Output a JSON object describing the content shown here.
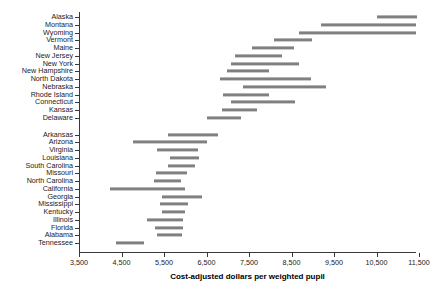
{
  "chart_data": {
    "type": "bar",
    "subtype": "range-bar",
    "title": "",
    "xlabel": "Cost-adjusted dollars per weighted pupil",
    "ylabel": "",
    "xlim": [
      3500,
      11500
    ],
    "xticks": [
      3500,
      4500,
      5500,
      6500,
      7500,
      8500,
      9500,
      10500,
      11500
    ],
    "xticklabels": [
      "3,500",
      "4,500",
      "5,500",
      "6,500",
      "7,500",
      "8,500",
      "9,500",
      "10,500",
      "11,500"
    ],
    "grid": false,
    "legend": null,
    "bar_color": "#808080",
    "axis_color": "#3a3a3a",
    "groups": [
      {
        "name": "upper-group",
        "categories": [
          "Alaska",
          "Montana",
          "Wyoming",
          "Vermont",
          "Maine",
          "New Jersey",
          "New York",
          "New Hampshire",
          "North Dakota",
          "Nebraska",
          "Rhode Island",
          "Connecticut",
          "Kansas",
          "Delaware"
        ],
        "ranges": [
          [
            10500,
            11450
          ],
          [
            9200,
            11420
          ],
          [
            8680,
            11430
          ],
          [
            8090,
            8990
          ],
          [
            7580,
            8560
          ],
          [
            7180,
            8280
          ],
          [
            7080,
            8680
          ],
          [
            6980,
            7960
          ],
          [
            6820,
            8950
          ],
          [
            7350,
            9300
          ],
          [
            6880,
            7960
          ],
          [
            7080,
            8580
          ],
          [
            6870,
            7680
          ],
          [
            6500,
            7310
          ]
        ]
      },
      {
        "name": "lower-group",
        "categories": [
          "Arkansas",
          "Arizona",
          "Virginia",
          "Louisiana",
          "South Carolina",
          "Missouri",
          "North Carolina",
          "California",
          "Georgia",
          "Mississippi",
          "Kentucky",
          "Illinois",
          "Florida",
          "Alabama",
          "Tennessee"
        ],
        "ranges": [
          [
            5600,
            6760
          ],
          [
            4770,
            6510
          ],
          [
            5340,
            6310
          ],
          [
            5650,
            6320
          ],
          [
            5590,
            6230
          ],
          [
            5300,
            6030
          ],
          [
            5270,
            5900
          ],
          [
            4230,
            5990
          ],
          [
            5460,
            6390
          ],
          [
            5410,
            6070
          ],
          [
            5460,
            6000
          ],
          [
            5110,
            5950
          ],
          [
            5290,
            5950
          ],
          [
            5330,
            5920
          ],
          [
            4360,
            5020
          ]
        ]
      }
    ]
  }
}
